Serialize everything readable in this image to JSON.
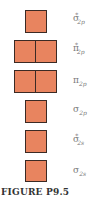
{
  "figure": {
    "caption": "FIGURE P9.5",
    "colors": {
      "box_fill": "#e8845f",
      "box_border": "#3b2a24",
      "label_text": "#7a7a7a",
      "caption_text": "#333333"
    },
    "orbitals": [
      {
        "symbol": "σ",
        "superscript": "*",
        "subscript": "2p",
        "boxes": 1
      },
      {
        "symbol": "π",
        "superscript": "*",
        "subscript": "2p",
        "boxes": 2
      },
      {
        "symbol": "π",
        "superscript": "",
        "subscript": "2p",
        "boxes": 2
      },
      {
        "symbol": "σ",
        "superscript": "",
        "subscript": "2p",
        "boxes": 1
      },
      {
        "symbol": "σ",
        "superscript": "*",
        "subscript": "2s",
        "boxes": 1
      },
      {
        "symbol": "σ",
        "superscript": "",
        "subscript": "2s",
        "boxes": 1
      }
    ]
  }
}
